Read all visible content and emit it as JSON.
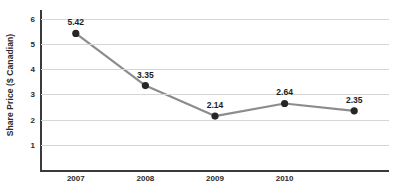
{
  "chart_data": {
    "type": "line",
    "title": "",
    "xlabel": "",
    "ylabel": "Share Price ($ Canadian)",
    "categories": [
      "2007",
      "2008",
      "2009",
      "2010",
      ""
    ],
    "x_tick_labels": [
      "2007",
      "2008",
      "2009",
      "2010"
    ],
    "values": [
      5.42,
      3.35,
      2.14,
      2.64,
      2.35
    ],
    "point_labels": [
      "5.42",
      "3.35",
      "2.14",
      "2.64",
      "2.35"
    ],
    "y_ticks": [
      1,
      2,
      3,
      4,
      5,
      6
    ],
    "y_tick_labels": [
      "1",
      "2",
      "3",
      "4",
      "5",
      "6"
    ],
    "ylim": [
      0,
      6.35
    ],
    "grid": true,
    "legend": "none",
    "series": [
      {
        "name": "Share Price",
        "values": [
          5.42,
          3.35,
          2.14,
          2.64,
          2.35
        ]
      }
    ],
    "colors": {
      "line": "#8c8c8c",
      "marker": "#262626",
      "gridline": "#d6d6d6",
      "axis": "#3a3a3a",
      "text": "#2b2b2b",
      "background": "#ffffff"
    }
  }
}
